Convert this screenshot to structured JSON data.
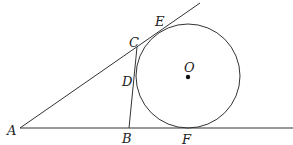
{
  "figure": {
    "type": "geometry",
    "points": {
      "A": {
        "label": "A",
        "x": 20,
        "y": 128
      },
      "B": {
        "label": "B",
        "x": 129,
        "y": 128
      },
      "C": {
        "label": "C",
        "x": 137,
        "y": 47
      },
      "D": {
        "label": "D",
        "x": 135,
        "y": 76
      },
      "E": {
        "label": "E",
        "x": 162,
        "y": 30
      },
      "F": {
        "label": "F",
        "x": 188,
        "y": 128
      },
      "O": {
        "label": "O",
        "x": 188,
        "y": 76
      }
    },
    "circle": {
      "center": "O",
      "radius": 52
    },
    "colors": {
      "stroke": "#333333",
      "background": "#ffffff"
    }
  }
}
